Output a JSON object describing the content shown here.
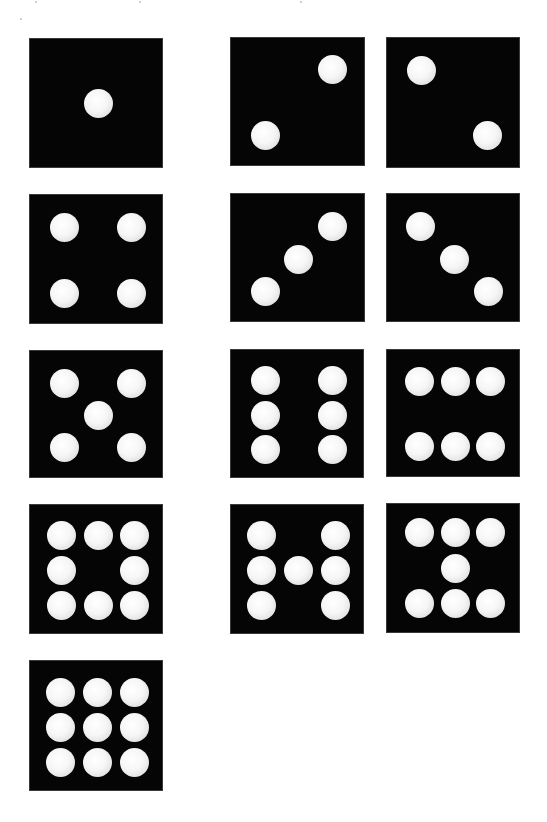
{
  "canvas": {
    "width": 547,
    "height": 822,
    "background": "#ffffff"
  },
  "colors": {
    "die_face": "#050505",
    "pip": "#f6f6f6",
    "background": "#ffffff"
  },
  "pip_diameter": 29,
  "dice": [
    {
      "id": "die-1",
      "value": 1,
      "pattern": "center",
      "box": [
        29,
        38,
        134,
        130
      ],
      "pips": [
        [
          97,
          102
        ]
      ]
    },
    {
      "id": "die-2a",
      "value": 2,
      "pattern": "diagonal-rising",
      "box": [
        230,
        37,
        135,
        129
      ],
      "pips": [
        [
          331,
          68
        ],
        [
          264,
          134
        ]
      ]
    },
    {
      "id": "die-2b",
      "value": 2,
      "pattern": "diagonal-falling",
      "box": [
        386,
        37,
        134,
        131
      ],
      "pips": [
        [
          420,
          69
        ],
        [
          486,
          134
        ]
      ]
    },
    {
      "id": "die-4",
      "value": 4,
      "pattern": "corners",
      "box": [
        29,
        194,
        134,
        130
      ],
      "pips": [
        [
          63,
          226
        ],
        [
          130,
          226
        ],
        [
          63,
          292
        ],
        [
          130,
          292
        ]
      ]
    },
    {
      "id": "die-3a",
      "value": 3,
      "pattern": "diagonal-rising",
      "box": [
        230,
        193,
        135,
        129
      ],
      "pips": [
        [
          331,
          225
        ],
        [
          297,
          258
        ],
        [
          264,
          290
        ]
      ]
    },
    {
      "id": "die-3b",
      "value": 3,
      "pattern": "diagonal-falling",
      "box": [
        386,
        193,
        134,
        129
      ],
      "pips": [
        [
          419,
          225
        ],
        [
          453,
          258
        ],
        [
          487,
          290
        ]
      ]
    },
    {
      "id": "die-5",
      "value": 5,
      "pattern": "quincunx",
      "box": [
        29,
        350,
        134,
        128
      ],
      "pips": [
        [
          63,
          382
        ],
        [
          130,
          382
        ],
        [
          97,
          414
        ],
        [
          63,
          446
        ],
        [
          130,
          446
        ]
      ]
    },
    {
      "id": "die-6a",
      "value": 6,
      "pattern": "two-columns",
      "box": [
        230,
        349,
        134,
        129
      ],
      "pips": [
        [
          264,
          379
        ],
        [
          331,
          379
        ],
        [
          264,
          414
        ],
        [
          331,
          414
        ],
        [
          264,
          448
        ],
        [
          331,
          448
        ]
      ]
    },
    {
      "id": "die-6b",
      "value": 6,
      "pattern": "two-rows",
      "box": [
        386,
        349,
        134,
        128
      ],
      "pips": [
        [
          418,
          380
        ],
        [
          454,
          380
        ],
        [
          489,
          380
        ],
        [
          418,
          445
        ],
        [
          454,
          445
        ],
        [
          489,
          445
        ]
      ]
    },
    {
      "id": "die-8",
      "value": 8,
      "pattern": "ring",
      "box": [
        29,
        504,
        134,
        130
      ],
      "pips": [
        [
          60,
          534
        ],
        [
          97,
          534
        ],
        [
          133,
          534
        ],
        [
          60,
          569
        ],
        [
          133,
          569
        ],
        [
          60,
          604
        ],
        [
          97,
          604
        ],
        [
          133,
          604
        ]
      ]
    },
    {
      "id": "die-7a",
      "value": 7,
      "pattern": "H-shape",
      "box": [
        230,
        504,
        134,
        130
      ],
      "pips": [
        [
          260,
          534
        ],
        [
          334,
          534
        ],
        [
          260,
          569
        ],
        [
          297,
          569
        ],
        [
          334,
          569
        ],
        [
          260,
          604
        ],
        [
          334,
          604
        ]
      ]
    },
    {
      "id": "die-7b",
      "value": 7,
      "pattern": "I-shape",
      "box": [
        386,
        503,
        134,
        130
      ],
      "pips": [
        [
          418,
          531
        ],
        [
          454,
          531
        ],
        [
          489,
          531
        ],
        [
          454,
          567
        ],
        [
          418,
          602
        ],
        [
          454,
          602
        ],
        [
          489,
          602
        ]
      ]
    },
    {
      "id": "die-9",
      "value": 9,
      "pattern": "grid-3x3",
      "box": [
        29,
        660,
        134,
        131
      ],
      "pips": [
        [
          59,
          691
        ],
        [
          96,
          691
        ],
        [
          133,
          691
        ],
        [
          59,
          726
        ],
        [
          96,
          726
        ],
        [
          133,
          726
        ],
        [
          59,
          761
        ],
        [
          96,
          761
        ],
        [
          133,
          761
        ]
      ]
    }
  ],
  "specks": [
    [
      35,
      1
    ],
    [
      139,
      1
    ],
    [
      300,
      1
    ],
    [
      20,
      18
    ]
  ]
}
